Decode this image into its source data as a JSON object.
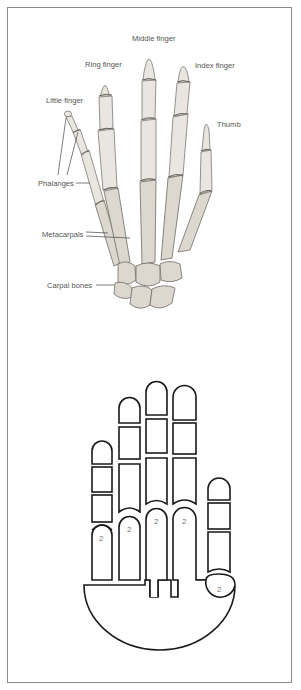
{
  "figure": {
    "anatomy_labels": {
      "middle_finger": "Middle finger",
      "ring_finger": "Ring finger",
      "index_finger": "Index finger",
      "little_finger": "Little finger",
      "thumb": "Thumb",
      "phalanges": "Phalanges",
      "metacarpals": "Metacarpals",
      "carpal_bones": "Carpal bones"
    },
    "schematic": {
      "digit_labels": [
        "2",
        "2",
        "2",
        "2",
        "2"
      ]
    },
    "colors": {
      "frame": "#8a8a8a",
      "bone_fill": "#e9e6df",
      "bone_shadow": "#7c7a74",
      "schematic_stroke": "#1a1a1a",
      "label_text": "#555555"
    }
  }
}
